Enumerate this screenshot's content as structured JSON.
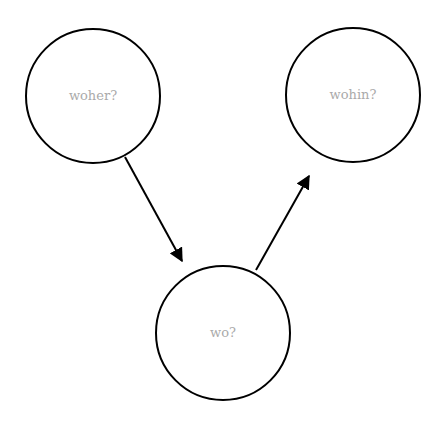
{
  "diagram": {
    "nodes": [
      {
        "id": "woher",
        "label": "woher?"
      },
      {
        "id": "wohin",
        "label": "wohin?"
      },
      {
        "id": "wo",
        "label": "wo?"
      }
    ],
    "edges": [
      {
        "from": "woher",
        "to": "wo"
      },
      {
        "from": "wo",
        "to": "wohin"
      }
    ],
    "colors": {
      "stroke": "#000000",
      "label": "#aaaaaa",
      "background": "#ffffff"
    }
  }
}
